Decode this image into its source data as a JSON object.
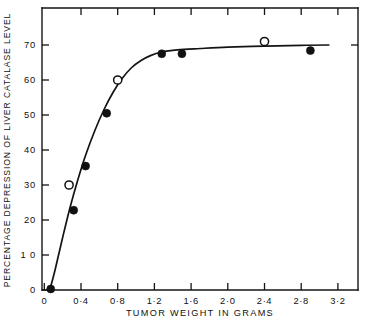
{
  "chart_data": {
    "type": "scatter",
    "title": "",
    "xlabel": "TUMOR WEIGHT IN GRAMS",
    "ylabel": "PERCENTAGE DEPRESSION OF LIVER CATALASE LEVEL",
    "xlim": [
      0,
      3.45
    ],
    "ylim": [
      0,
      75
    ],
    "grid": false,
    "legend": "none",
    "x_tick_labels": [
      "0",
      "0·4",
      "0·8",
      "1·2",
      "1·6",
      "2·0",
      "2·4",
      "2·8",
      "3·2"
    ],
    "x_tick_values": [
      0,
      0.4,
      0.8,
      1.2,
      1.6,
      2.0,
      2.4,
      2.8,
      3.2
    ],
    "y_tick_labels": [
      "0",
      "1 0",
      "20",
      "30",
      "40",
      "50",
      "60",
      "70"
    ],
    "y_tick_values": [
      0,
      10,
      20,
      30,
      40,
      50,
      60,
      70
    ],
    "series": [
      {
        "name": "filled-circles",
        "marker": "filled-circle",
        "points": [
          {
            "x": 0.07,
            "y": 0.3
          },
          {
            "x": 0.32,
            "y": 22.8
          },
          {
            "x": 0.45,
            "y": 35.4
          },
          {
            "x": 0.68,
            "y": 50.5
          },
          {
            "x": 1.28,
            "y": 67.5
          },
          {
            "x": 1.5,
            "y": 67.5
          },
          {
            "x": 2.9,
            "y": 68.4
          }
        ]
      },
      {
        "name": "open-circles",
        "marker": "open-circle",
        "points": [
          {
            "x": 0.27,
            "y": 30.0
          },
          {
            "x": 0.8,
            "y": 60.0
          },
          {
            "x": 2.4,
            "y": 71.0
          }
        ]
      }
    ],
    "fit_curve": {
      "name": "saturation-curve",
      "points": [
        {
          "x": 0.06,
          "y": 0.0
        },
        {
          "x": 0.12,
          "y": 6.0
        },
        {
          "x": 0.2,
          "y": 15.0
        },
        {
          "x": 0.28,
          "y": 23.5
        },
        {
          "x": 0.36,
          "y": 31.0
        },
        {
          "x": 0.45,
          "y": 38.5
        },
        {
          "x": 0.55,
          "y": 45.5
        },
        {
          "x": 0.65,
          "y": 51.5
        },
        {
          "x": 0.75,
          "y": 56.5
        },
        {
          "x": 0.85,
          "y": 60.5
        },
        {
          "x": 0.95,
          "y": 63.5
        },
        {
          "x": 1.05,
          "y": 65.5
        },
        {
          "x": 1.15,
          "y": 66.9
        },
        {
          "x": 1.28,
          "y": 68.0
        },
        {
          "x": 1.45,
          "y": 68.6
        },
        {
          "x": 1.7,
          "y": 69.0
        },
        {
          "x": 2.0,
          "y": 69.4
        },
        {
          "x": 2.4,
          "y": 69.7
        },
        {
          "x": 2.8,
          "y": 69.9
        },
        {
          "x": 3.1,
          "y": 70.0
        }
      ]
    },
    "colors": {
      "axis": "#141414",
      "marker": "#111111",
      "curve": "#141414",
      "background": "#ffffff"
    }
  },
  "axes": {
    "frame": {
      "left": 42,
      "right": 358,
      "top": 8,
      "bottom": 290
    },
    "x_zero_px": 44.3,
    "x_unit_px": 91.75,
    "y_zero_px": 290,
    "y_unit_px": 3.5
  }
}
